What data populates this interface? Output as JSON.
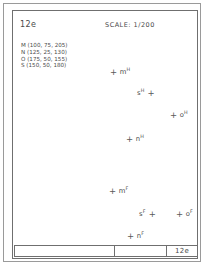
{
  "header": {
    "sheet_id": "12e",
    "scale": "SCALE: 1/200"
  },
  "legend": {
    "entries": [
      "M (100, 75, 205)",
      "N (125, 25, 130)",
      "O (175, 50, 155)",
      "S (150, 50, 180)"
    ]
  },
  "points": [
    {
      "name": "m",
      "sup": "H",
      "marker": "+",
      "marker_side": "left",
      "cross": "+",
      "x": 97,
      "y": 57
    },
    {
      "name": "s",
      "sup": "H",
      "marker": "+",
      "marker_side": "right",
      "cross": "+",
      "x": 124,
      "y": 78
    },
    {
      "name": "o",
      "sup": "H",
      "marker": "+",
      "marker_side": "left",
      "cross": "+",
      "x": 157,
      "y": 100
    },
    {
      "name": "n",
      "sup": "H",
      "marker": "+",
      "marker_side": "left",
      "cross": "+",
      "x": 113,
      "y": 124
    },
    {
      "name": "m",
      "sup": "F",
      "marker": "+",
      "marker_side": "left",
      "cross": "+",
      "x": 96,
      "y": 176
    },
    {
      "name": "s",
      "sup": "F",
      "marker": "+",
      "marker_side": "right",
      "cross": "+",
      "x": 126,
      "y": 199
    },
    {
      "name": "o",
      "sup": "F",
      "marker": "+",
      "marker_side": "left",
      "cross": "+",
      "x": 163,
      "y": 199
    },
    {
      "name": "n",
      "sup": "F",
      "marker": "+",
      "marker_side": "left",
      "cross": "+",
      "x": 114,
      "y": 221
    }
  ],
  "titleblock": {
    "cell_left": "",
    "cell_mid": "",
    "cell_right": "12e"
  },
  "colors": {
    "ink": "#4a4a4a",
    "frame": "#6f6f6f",
    "outer_border": "#9a9a9a",
    "paper": "#ffffff"
  }
}
